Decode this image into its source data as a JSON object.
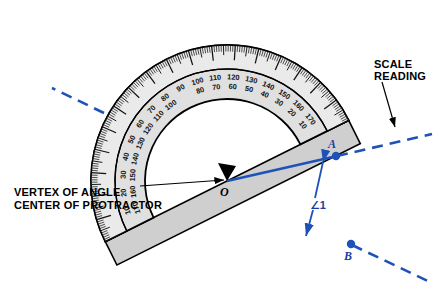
{
  "figure": {
    "type": "protractor-angle-diagram",
    "background_color": "#ffffff"
  },
  "colors": {
    "ink": "#000000",
    "blue": "#1f52b8",
    "blue_dark": "#1a3fa0",
    "body_fill": "#d6d6d6",
    "scale_fill": "#e8e8e8",
    "ruler_fill": "#cfcfcf"
  },
  "callouts": [
    {
      "id": "scale-reading",
      "lines": [
        "SCALE",
        "READING"
      ],
      "x": 378,
      "y": 64,
      "points_to": {
        "x": 394,
        "y": 130
      }
    },
    {
      "id": "vertex-of-angle",
      "lines": [
        "VERTEX OF ANGLE",
        "CENTER OF PROTRACTOR"
      ],
      "x": 14,
      "y": 192,
      "points_to": {
        "x": 224,
        "y": 180
      }
    }
  ],
  "points": [
    {
      "name": "O",
      "label": "O",
      "x": 227,
      "y": 181,
      "color": "#000000",
      "dot": false,
      "role": "vertex of angle / center of protractor"
    },
    {
      "name": "A",
      "label": "A",
      "x": 336,
      "y": 156,
      "color": "#1f52b8",
      "dot": true,
      "role": "scale reading point on ray OA"
    },
    {
      "name": "B",
      "label": "B",
      "x": 351,
      "y": 244,
      "color": "#1f52b8",
      "dot": true,
      "role": "point on ray OB along straight edge"
    }
  ],
  "angle": {
    "label": "∠1",
    "label_x": 316,
    "label_y": 208,
    "measure_degrees": 40,
    "between": [
      "OA",
      "OB"
    ]
  },
  "protractor": {
    "center": {
      "x": 227,
      "y": 181
    },
    "rotation_degrees": -26.5,
    "radius_outer": 136,
    "radius_scale_inner": 112,
    "radius_body_inner": 82,
    "outer_scale_sequence": [
      10,
      20,
      30,
      40,
      50,
      60,
      70,
      80,
      90,
      100,
      110,
      120,
      130,
      140,
      150,
      160,
      170
    ],
    "inner_scale_sequence": [
      170,
      160,
      150,
      140,
      130,
      120,
      110,
      100,
      90,
      80,
      70,
      60,
      50,
      40,
      30,
      20,
      10
    ],
    "tick_interval_degrees": 1,
    "major_tick_interval_degrees": 10,
    "mid_tick_interval_degrees": 5
  },
  "rays": [
    {
      "id": "ray-OA",
      "from": "O",
      "to": "A",
      "color": "#1f52b8",
      "style": "solid",
      "extends_dashed_to": {
        "x": 432,
        "y": 134
      }
    },
    {
      "id": "ray-OB",
      "from": "O",
      "to": "B",
      "color": "#1f52b8",
      "style": "solid-on-edge",
      "extends_dashed_to": {
        "x": 430,
        "y": 282
      }
    },
    {
      "id": "edge-left-dashed",
      "from": "protractor-left-end",
      "to": {
        "x": 52,
        "y": 88
      },
      "color": "#1f52b8",
      "style": "dashed"
    }
  ]
}
